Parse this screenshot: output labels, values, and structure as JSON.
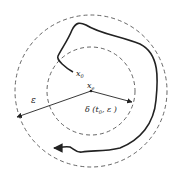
{
  "diagram": {
    "type": "stability-definition",
    "center": {
      "label": "x",
      "subscript": "e"
    },
    "start_point": {
      "label": "x",
      "subscript": "0"
    },
    "outer_radius_label": "ε",
    "inner_radius_label": "δ (t",
    "inner_radius_subscript": "0",
    "inner_radius_suffix": ", ε )",
    "colors": {
      "line": "#222222",
      "dashed": "#555555",
      "background": "#ffffff"
    }
  }
}
